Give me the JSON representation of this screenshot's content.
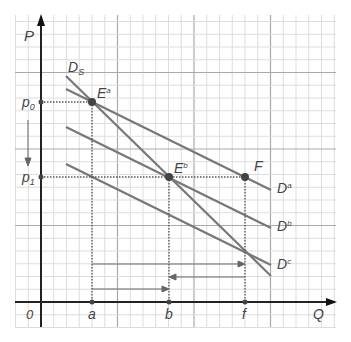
{
  "axes": {
    "y_label": "P",
    "x_label": "Q",
    "origin_label": "0",
    "y_ticks": [
      {
        "name": "p",
        "sub": "0"
      },
      {
        "name": "p",
        "sub": "1"
      }
    ],
    "x_ticks": [
      "a",
      "b",
      "f"
    ]
  },
  "points": [
    {
      "id": "Ea",
      "label": "E",
      "sup": "a"
    },
    {
      "id": "Eb",
      "label": "E",
      "sup": "b"
    },
    {
      "id": "F",
      "label": "F",
      "sup": ""
    }
  ],
  "curves": [
    {
      "id": "Ds",
      "label": "D",
      "sub": "S"
    },
    {
      "id": "Da",
      "label": "D",
      "sup": "a"
    },
    {
      "id": "Db",
      "label": "D",
      "sup": "b"
    },
    {
      "id": "Dc",
      "label": "D",
      "sup": "c"
    }
  ],
  "colors": {
    "line": "#777777",
    "axis": "#222222",
    "grid_minor": "#dddddd",
    "grid_major": "#aaaaaa"
  }
}
